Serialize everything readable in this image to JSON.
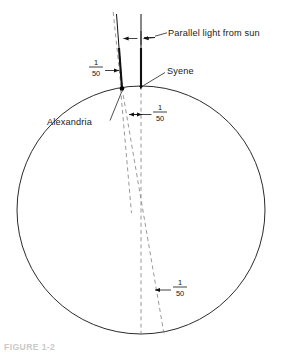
{
  "figure": {
    "title_caption": "FIGURE 1-2",
    "background_color": "#ffffff",
    "line_color": "#1a1a1a",
    "dashed_color": "#8c8c8c"
  },
  "labels": {
    "parallel_light": "Parallel light from sun",
    "syene": "Syene",
    "alexandria": "Alexandria"
  },
  "fractions": [
    {
      "id": "angle-top-left",
      "numerator": "1",
      "denominator": "50",
      "x": 96,
      "y": 68
    },
    {
      "id": "angle-arc-surface",
      "numerator": "1",
      "denominator": "50",
      "x": 157,
      "y": 113
    },
    {
      "id": "angle-center",
      "numerator": "1",
      "denominator": "50",
      "x": 177,
      "y": 288
    }
  ],
  "geometry": {
    "earth": {
      "center_x": 141,
      "center_y": 210,
      "radius": 124
    },
    "alexandria_point": {
      "x": 122,
      "y": 88
    },
    "syene_point": {
      "x": 141,
      "y": 86
    },
    "sun_rays": [
      {
        "from_x": 118,
        "from_y": 12,
        "to_x": 122,
        "to_y": 88
      },
      {
        "from_x": 141,
        "from_y": 12,
        "to_x": 141,
        "to_y": 86
      }
    ],
    "dashed_lines": [
      {
        "from_x": 114,
        "from_y": 12,
        "to_x": 120,
        "to_y": 213
      },
      {
        "from_x": 122,
        "from_y": 88,
        "to_x": 160,
        "to_y": 334
      },
      {
        "from_x": 141,
        "from_y": 86,
        "to_x": 141,
        "to_y": 334
      }
    ]
  },
  "colors": {
    "stroke": "#1f1f1f",
    "dashed": "#8c8c8c",
    "caption": "#c9c9c9"
  }
}
